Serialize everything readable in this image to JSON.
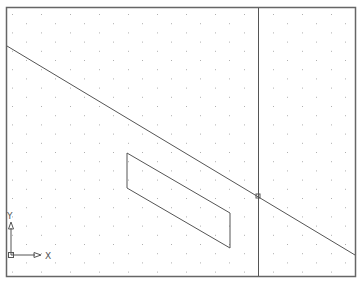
{
  "viewport": {
    "name": "cad-drawing-viewport",
    "background": "#ffffff",
    "border_color": "#555555",
    "grid_color": "#b0b0b0",
    "line_color": "#555555"
  },
  "ucs_icon": {
    "x_label": "X",
    "y_label": "Y"
  },
  "objects": {
    "diagonal_line": {
      "x1": 7,
      "y1": 46,
      "x2": 355,
      "y2": 255
    },
    "vertical_line": {
      "x": 258,
      "y1": 7,
      "y2": 276
    },
    "parallelogram": {
      "points": [
        [
          127,
          153
        ],
        [
          230,
          213
        ],
        [
          230,
          248
        ],
        [
          127,
          188
        ]
      ]
    },
    "intersection_marker": {
      "x": 258,
      "y": 196,
      "size": 4
    }
  }
}
